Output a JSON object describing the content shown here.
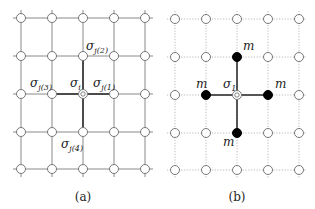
{
  "panels": [
    {
      "id": "a",
      "caption": "(a)",
      "grid": {
        "cols": [
          21,
          52,
          83,
          114,
          145
        ],
        "rows": [
          18,
          56,
          94,
          132,
          169
        ],
        "line_style": "solid",
        "line_color": "#8a8a8a"
      },
      "center": {
        "col": 2,
        "row": 2,
        "label": "σ",
        "sub": "i"
      },
      "neighbors": [
        {
          "col": 3,
          "row": 2,
          "label": "σ",
          "sub": "j(1)",
          "lx": 93,
          "ly": 87
        },
        {
          "col": 2,
          "row": 1,
          "label": "σ",
          "sub": "j(2)",
          "lx": 86,
          "ly": 50
        },
        {
          "col": 1,
          "row": 2,
          "label": "σ",
          "sub": "j(3)",
          "lx": 30,
          "ly": 87
        },
        {
          "col": 2,
          "row": 3,
          "label": "σ",
          "sub": "j(4)",
          "lx": 61,
          "ly": 148
        }
      ],
      "center_label_pos": {
        "x": 70,
        "y": 87
      },
      "caption_pos": {
        "x": 83,
        "y": 201
      }
    },
    {
      "id": "b",
      "caption": "(b)",
      "grid": {
        "cols": [
          175,
          206,
          237,
          268,
          299
        ],
        "rows": [
          19,
          57,
          95,
          133,
          170
        ],
        "line_style": "dotted",
        "line_color": "#b8b8b8"
      },
      "center": {
        "col": 2,
        "row": 2,
        "label": "σ",
        "sub": "1"
      },
      "neighbors": [
        {
          "col": 3,
          "row": 2,
          "label": "m",
          "lx": 275,
          "ly": 88
        },
        {
          "col": 2,
          "row": 1,
          "label": "m",
          "lx": 243,
          "ly": 50
        },
        {
          "col": 1,
          "row": 2,
          "label": "m",
          "lx": 196,
          "ly": 88
        },
        {
          "col": 2,
          "row": 3,
          "label": "m",
          "lx": 223,
          "ly": 146
        }
      ],
      "center_label_pos": {
        "x": 223,
        "y": 88
      },
      "caption_pos": {
        "x": 237,
        "y": 201
      }
    }
  ],
  "colors": {
    "node_fill": "#ffffff",
    "node_stroke": "#777777",
    "filled_node": "#000000",
    "bond_line": "#222222"
  }
}
